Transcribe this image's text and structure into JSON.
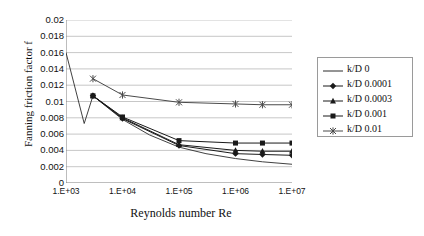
{
  "chart_data": {
    "type": "line",
    "title": "",
    "xlabel": "Reynolds number Re",
    "ylabel": "Fanning friction factor f",
    "xscale": "log",
    "yscale": "linear",
    "xlim": [
      1000,
      10000000
    ],
    "ylim": [
      0,
      0.02
    ],
    "ytick_labels": [
      "0.02",
      "0.018",
      "0.016",
      "0.014",
      "0.012",
      "0.01",
      "0.008",
      "0.006",
      "0.004",
      "0.002",
      "0"
    ],
    "ytick_values": [
      0.02,
      0.018,
      0.016,
      0.014,
      0.012,
      0.01,
      0.008,
      0.006,
      0.004,
      0.002,
      0
    ],
    "xtick_labels": [
      "1.E+03",
      "1.E+04",
      "1.E+05",
      "1.E+06",
      "1.E+07"
    ],
    "xtick_values": [
      1000,
      10000,
      100000,
      1000000,
      10000000
    ],
    "grid": "horizontal",
    "legend_position": "right-outside",
    "series": [
      {
        "name": "k/D 0",
        "marker": "none",
        "color": "#2b2b2b",
        "x": [
          1000,
          2100,
          3000,
          4000,
          10000,
          30000,
          100000,
          300000,
          1000000,
          3000000,
          10000000
        ],
        "y": [
          0.016,
          0.0073,
          0.0107,
          0.01,
          0.0078,
          0.0059,
          0.0044,
          0.0036,
          0.003,
          0.0026,
          0.0023
        ]
      },
      {
        "name": "k/D 0.0001",
        "marker": "diamond",
        "color": "#1a1a1a",
        "x": [
          3000,
          10000,
          100000,
          1000000,
          3000000,
          10000000
        ],
        "y": [
          0.0107,
          0.0079,
          0.0046,
          0.0036,
          0.0035,
          0.0034
        ]
      },
      {
        "name": "k/D 0.0003",
        "marker": "triangle",
        "color": "#1a1a1a",
        "x": [
          3000,
          10000,
          100000,
          1000000,
          3000000,
          10000000
        ],
        "y": [
          0.0107,
          0.008,
          0.0047,
          0.004,
          0.0039,
          0.0039
        ]
      },
      {
        "name": "k/D 0.001",
        "marker": "square",
        "color": "#1a1a1a",
        "x": [
          3000,
          10000,
          100000,
          1000000,
          3000000,
          10000000
        ],
        "y": [
          0.0107,
          0.0081,
          0.0052,
          0.0049,
          0.0049,
          0.0049
        ]
      },
      {
        "name": "k/D 0.01",
        "marker": "asterisk",
        "color": "#4a4a4a",
        "x": [
          3000,
          10000,
          100000,
          1000000,
          3000000,
          10000000
        ],
        "y": [
          0.0128,
          0.0108,
          0.0099,
          0.0097,
          0.0096,
          0.0096
        ]
      }
    ]
  },
  "legend": {
    "items": [
      {
        "label": "k/D 0"
      },
      {
        "label": "k/D 0.0001"
      },
      {
        "label": "k/D 0.0003"
      },
      {
        "label": "k/D 0.001"
      },
      {
        "label": "k/D 0.01"
      }
    ]
  },
  "axes": {
    "y_title": "Fanning friction factor f",
    "x_title": "Reynolds number Re"
  }
}
